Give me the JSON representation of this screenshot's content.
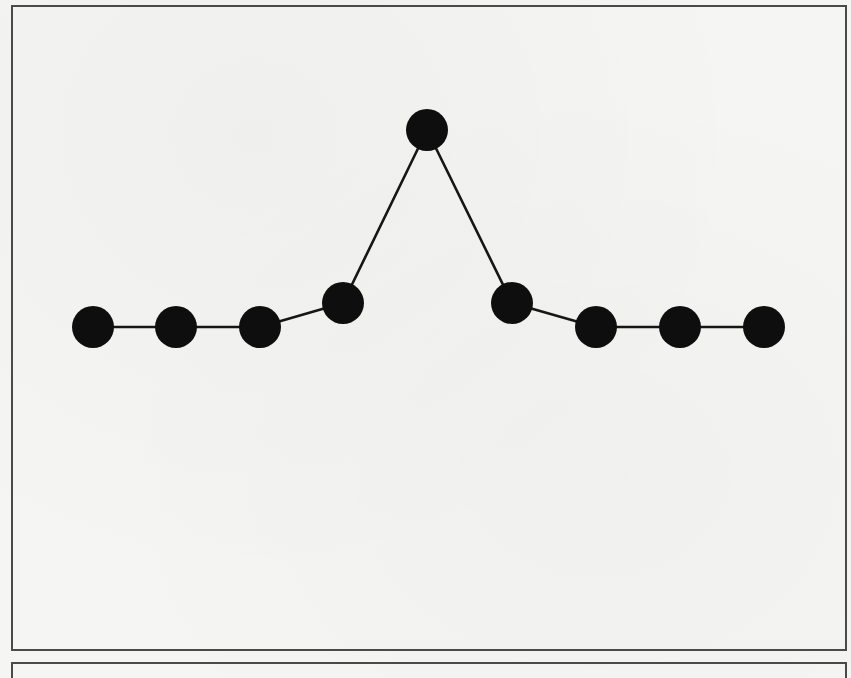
{
  "figure": {
    "type": "graph",
    "node_color": "#0e0e0e",
    "edge_color": "#161616",
    "border_color": "#4a4a4a",
    "background_color": "#f5f5f3",
    "node_radius": 21,
    "nodes": [
      {
        "id": "n1",
        "x": 93,
        "y": 327
      },
      {
        "id": "n2",
        "x": 176,
        "y": 327
      },
      {
        "id": "n3",
        "x": 260,
        "y": 327
      },
      {
        "id": "n4",
        "x": 343,
        "y": 303
      },
      {
        "id": "n5",
        "x": 427,
        "y": 130
      },
      {
        "id": "n6",
        "x": 512,
        "y": 303
      },
      {
        "id": "n7",
        "x": 596,
        "y": 327
      },
      {
        "id": "n8",
        "x": 680,
        "y": 327
      },
      {
        "id": "n9",
        "x": 764,
        "y": 327
      }
    ],
    "edges": [
      [
        "n1",
        "n2"
      ],
      [
        "n2",
        "n3"
      ],
      [
        "n3",
        "n4"
      ],
      [
        "n4",
        "n5"
      ],
      [
        "n5",
        "n6"
      ],
      [
        "n6",
        "n7"
      ],
      [
        "n7",
        "n8"
      ],
      [
        "n8",
        "n9"
      ]
    ]
  }
}
